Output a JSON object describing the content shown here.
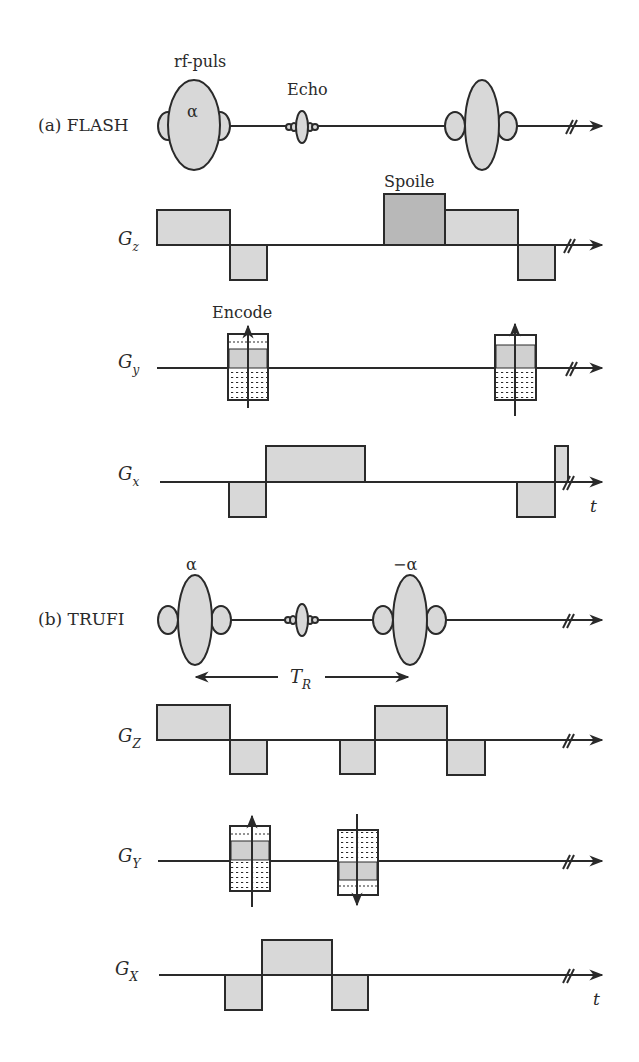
{
  "colors": {
    "line": "#2a2a2a",
    "fill": "#d8d8d8",
    "spoiler_fill": "#b8b8b8",
    "background": "#ffffff"
  },
  "flash": {
    "title": "(a) FLASH",
    "rf_label": "rf-puls",
    "echo_label": "Echo",
    "alpha_label": "α",
    "spoiler_label": "Spoile",
    "encode_label": "Encode",
    "gz_label": "G",
    "gz_sub": "z",
    "gy_label": "G",
    "gy_sub": "y",
    "gx_label": "G",
    "gx_sub": "x",
    "time_label": "t"
  },
  "trufi": {
    "title": "(b) TRUFI",
    "alpha_label": "α",
    "neg_alpha_label": "−α",
    "tr_label": "T",
    "tr_sub": "R",
    "gz_label": "G",
    "gz_sub": "Z",
    "gy_label": "G",
    "gy_sub": "Y",
    "gx_label": "G",
    "gx_sub": "X",
    "time_label": "t"
  }
}
